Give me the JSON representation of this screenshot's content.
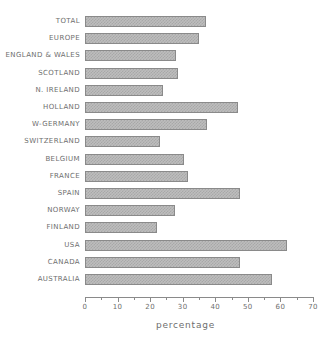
{
  "chart_data": {
    "type": "bar",
    "orientation": "horizontal",
    "title": "",
    "xlabel": "percentage",
    "ylabel": "",
    "xlim": [
      0,
      70
    ],
    "grid": false,
    "legend": null,
    "xticks": [
      0,
      10,
      20,
      30,
      40,
      50,
      60,
      70
    ],
    "xtick_labels": [
      "0",
      "10",
      "20",
      "30",
      "40",
      "50",
      "60",
      "70"
    ],
    "xminor_ticks": [
      5,
      15,
      25,
      35,
      45,
      55,
      65
    ],
    "categories": [
      "TOTAL",
      "EUROPE",
      "ENGLAND & WALES",
      "SCOTLAND",
      "N. IRELAND",
      "HOLLAND",
      "W-GERMANY",
      "SWITZERLAND",
      "BELGIUM",
      "FRANCE",
      "SPAIN",
      "NORWAY",
      "FINLAND",
      "USA",
      "CANADA",
      "AUSTRALIA"
    ],
    "values": [
      37,
      35,
      28,
      28.5,
      24,
      47,
      37.5,
      23,
      30.5,
      31.5,
      47.5,
      27.5,
      22,
      62,
      47.5,
      57.5
    ],
    "bar_fill_color": "#bdbdbd",
    "bar_edge_color": "#8a8a8a",
    "bar_pattern": "checkerboard-dither",
    "text_color": "#6e6e6e",
    "background_color": "#ffffff"
  }
}
